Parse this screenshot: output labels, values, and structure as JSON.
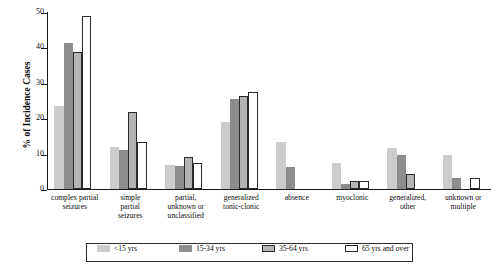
{
  "chart_data": {
    "type": "bar",
    "title": "",
    "subtitle": "",
    "xlabel": "",
    "ylabel": "% of Incidence Cases",
    "ylim": [
      0,
      50
    ],
    "yticks": [
      0,
      10,
      20,
      30,
      40,
      50
    ],
    "grid": false,
    "legend_position": "bottom",
    "categories": [
      "complex partial\nseizures",
      "simple\npartial\nseizures",
      "partial,\nunknown or\nunclassified",
      "generalized\ntonic-clonic",
      "absence",
      "myoclonic",
      "generalized,\nother",
      "unknown or\nmultiple"
    ],
    "series": [
      {
        "name": "<15 yrs",
        "color": "#cccccc",
        "values": [
          23.5,
          11.8,
          6.8,
          19.0,
          13.2,
          7.3,
          11.7,
          9.5
        ]
      },
      {
        "name": "15-34 yrs",
        "color": "#8d8d8d",
        "values": [
          41.3,
          11.0,
          6.5,
          25.3,
          6.3,
          1.5,
          9.5,
          3.0
        ]
      },
      {
        "name": "35-64 yrs",
        "color": "#b4b4b4",
        "values": [
          38.7,
          21.7,
          9.0,
          26.3,
          0.0,
          2.3,
          4.2,
          0.0
        ]
      },
      {
        "name": "65 yrs and over",
        "color": "#ffffff",
        "values": [
          48.8,
          13.3,
          7.3,
          27.3,
          0.0,
          2.3,
          0.0,
          3.0
        ]
      }
    ]
  }
}
